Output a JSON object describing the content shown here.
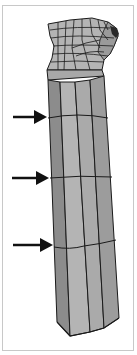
{
  "figure": {
    "colors": {
      "frame_border": "#c8c8c8",
      "face_light": "#b4b4b4",
      "face_mid": "#a2a2a2",
      "face_dark": "#8c8c8c",
      "edge": "#1a1a1a",
      "arrow": "#111111"
    },
    "arrows": [
      {
        "label": "edge-loop-1",
        "y": 117
      },
      {
        "label": "edge-loop-2",
        "y": 178
      },
      {
        "label": "edge-loop-3",
        "y": 246
      }
    ]
  }
}
